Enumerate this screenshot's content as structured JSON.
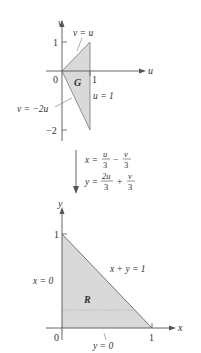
{
  "top_plot": {
    "axis_x_label": "u",
    "axis_y_label": "v",
    "origin_label": "0",
    "tick_u1": "1",
    "tick_v1": "1",
    "tick_vm2": "−2",
    "region_label": "G",
    "curve_upper": "v = u",
    "curve_right": "u = 1",
    "curve_lower": "v = −2u",
    "fill_color": "#d9d9d9"
  },
  "transform": {
    "eq_x_lhs": "x =",
    "eq_x_t1_num": "u",
    "eq_x_t1_den": "3",
    "eq_x_op": "−",
    "eq_x_t2_num": "v",
    "eq_x_t2_den": "3",
    "eq_y_lhs": "y =",
    "eq_y_t1_num": "2u",
    "eq_y_t1_den": "3",
    "eq_y_op": "+",
    "eq_y_t2_num": "v",
    "eq_y_t2_den": "3"
  },
  "bottom_plot": {
    "axis_x_label": "x",
    "axis_y_label": "y",
    "origin_label": "0",
    "tick_x1": "1",
    "tick_y1": "1",
    "region_label": "R",
    "curve_left": "x = 0",
    "curve_hyp": "x + y = 1",
    "curve_bottom": "y = 0",
    "fill_color": "#d9d9d9"
  }
}
